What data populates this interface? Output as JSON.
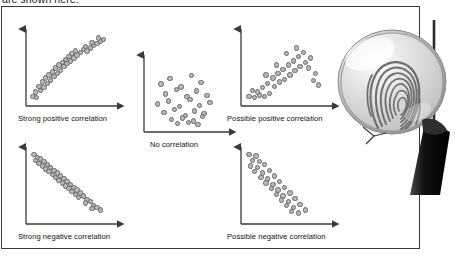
{
  "document": {
    "top_text": "are shown here.",
    "frame_color": "#3a3a3a",
    "background_color": "#ffffff"
  },
  "illustration": {
    "name": "magnifying-glass-over-fingerprint",
    "lens_color": "#d6d6d6",
    "handle_color": "#1c1c1c",
    "fingerprint_color": "#6b6b6b"
  },
  "chart_data": [
    {
      "type": "scatter",
      "title": "Strong positive correlation",
      "xlabel": "",
      "ylabel": "",
      "xlim": [
        0,
        100
      ],
      "ylim": [
        0,
        100
      ],
      "grid": false,
      "legend": "none",
      "marker_fill": "#b8b8b8",
      "marker_edge": "#676767",
      "x": [
        5,
        9,
        8,
        14,
        12,
        18,
        16,
        22,
        20,
        26,
        24,
        30,
        28,
        34,
        32,
        38,
        36,
        42,
        40,
        46,
        44,
        50,
        48,
        54,
        52,
        58,
        56,
        62,
        66,
        70,
        68,
        74,
        78,
        76,
        82,
        86,
        84,
        90
      ],
      "y": [
        8,
        6,
        14,
        16,
        22,
        20,
        28,
        26,
        34,
        30,
        38,
        36,
        42,
        40,
        48,
        44,
        52,
        50,
        56,
        54,
        60,
        58,
        64,
        62,
        68,
        66,
        72,
        70,
        74,
        72,
        78,
        76,
        80,
        84,
        82,
        86,
        90,
        88
      ]
    },
    {
      "type": "scatter",
      "title": "No correlation",
      "xlabel": "",
      "ylabel": "",
      "xlim": [
        0,
        100
      ],
      "ylim": [
        0,
        100
      ],
      "grid": false,
      "legend": "none",
      "marker_fill": "#b8b8b8",
      "marker_edge": "#676767",
      "x": [
        18,
        30,
        44,
        58,
        70,
        24,
        38,
        52,
        64,
        78,
        14,
        28,
        42,
        56,
        68,
        82,
        22,
        36,
        50,
        62,
        74,
        32,
        46,
        60,
        72,
        40,
        54,
        66
      ],
      "y": [
        62,
        70,
        58,
        74,
        64,
        48,
        54,
        44,
        52,
        46,
        34,
        38,
        30,
        40,
        32,
        36,
        22,
        26,
        18,
        24,
        20,
        12,
        14,
        10,
        16,
        6,
        8,
        5
      ]
    },
    {
      "type": "scatter",
      "title": "Possible positive correlation",
      "xlabel": "",
      "ylabel": "",
      "xlim": [
        0,
        100
      ],
      "ylim": [
        0,
        100
      ],
      "grid": false,
      "legend": "none",
      "marker_fill": "#b8b8b8",
      "marker_edge": "#676767",
      "x": [
        6,
        12,
        18,
        24,
        10,
        16,
        22,
        30,
        28,
        36,
        34,
        42,
        40,
        48,
        46,
        54,
        52,
        60,
        58,
        66,
        64,
        72,
        70,
        78,
        76,
        84,
        82,
        88,
        62,
        50,
        38,
        26
      ],
      "y": [
        8,
        6,
        10,
        8,
        16,
        14,
        20,
        12,
        26,
        22,
        34,
        28,
        40,
        32,
        46,
        38,
        52,
        44,
        58,
        50,
        64,
        56,
        70,
        62,
        48,
        40,
        30,
        24,
        76,
        68,
        52,
        38
      ]
    },
    {
      "type": "scatter",
      "title": "Strong negative correlation",
      "xlabel": "",
      "ylabel": "",
      "xlim": [
        0,
        100
      ],
      "ylim": [
        0,
        100
      ],
      "grid": false,
      "legend": "none",
      "marker_fill": "#b8b8b8",
      "marker_edge": "#676767",
      "x": [
        6,
        10,
        8,
        14,
        12,
        18,
        16,
        22,
        20,
        26,
        24,
        30,
        28,
        34,
        32,
        38,
        36,
        42,
        40,
        46,
        44,
        50,
        48,
        54,
        52,
        58,
        56,
        62,
        60,
        66,
        70,
        68,
        74,
        78,
        76,
        82,
        86
      ],
      "y": [
        92,
        88,
        84,
        86,
        80,
        82,
        76,
        78,
        72,
        74,
        68,
        70,
        64,
        66,
        60,
        62,
        56,
        58,
        52,
        54,
        48,
        50,
        44,
        46,
        40,
        42,
        36,
        38,
        32,
        34,
        28,
        24,
        26,
        20,
        16,
        18,
        14
      ]
    },
    {
      "type": "scatter",
      "title": "Possible negative correlation",
      "xlabel": "",
      "ylabel": "",
      "xlim": [
        0,
        100
      ],
      "ylim": [
        0,
        100
      ],
      "grid": false,
      "legend": "none",
      "marker_fill": "#b8b8b8",
      "marker_edge": "#676767",
      "x": [
        6,
        14,
        10,
        18,
        8,
        16,
        24,
        12,
        22,
        30,
        20,
        28,
        36,
        26,
        34,
        42,
        32,
        40,
        48,
        38,
        46,
        54,
        44,
        52,
        60,
        50,
        58,
        66,
        56,
        64,
        72
      ],
      "y": [
        92,
        90,
        84,
        82,
        76,
        74,
        78,
        68,
        66,
        70,
        60,
        58,
        62,
        52,
        50,
        54,
        44,
        42,
        46,
        36,
        34,
        38,
        28,
        26,
        30,
        20,
        18,
        22,
        12,
        10,
        14
      ]
    }
  ]
}
